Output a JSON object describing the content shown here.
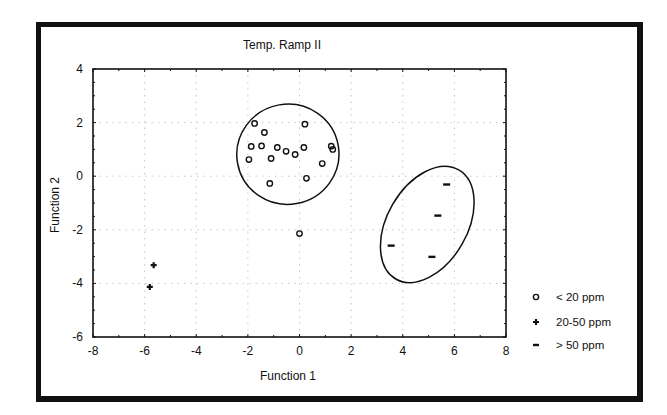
{
  "chart_data": {
    "type": "scatter",
    "title": "Temp. Ramp II",
    "xlabel": "Function 1",
    "ylabel": "Function 2",
    "xlim": [
      -8,
      8
    ],
    "ylim": [
      -6,
      4
    ],
    "xticks": [
      -8,
      -6,
      -4,
      -2,
      0,
      2,
      4,
      6,
      8
    ],
    "yticks": [
      -6,
      -4,
      -2,
      0,
      2,
      4
    ],
    "grid": true,
    "legend_position": "right-bottom",
    "series": [
      {
        "name": "< 20 ppm",
        "marker": "open-circle",
        "points": [
          [
            -1.74,
            1.97
          ],
          [
            0.21,
            1.94
          ],
          [
            -1.36,
            1.63
          ],
          [
            -1.87,
            1.11
          ],
          [
            -1.47,
            1.13
          ],
          [
            -0.86,
            1.07
          ],
          [
            -0.52,
            0.93
          ],
          [
            -0.17,
            0.81
          ],
          [
            0.17,
            1.07
          ],
          [
            1.23,
            1.12
          ],
          [
            1.29,
            1.0
          ],
          [
            -1.96,
            0.62
          ],
          [
            -1.1,
            0.66
          ],
          [
            0.88,
            0.47
          ],
          [
            -1.15,
            -0.27
          ],
          [
            0.27,
            -0.08
          ],
          [
            0.0,
            -2.14
          ]
        ]
      },
      {
        "name": "20-50 ppm",
        "marker": "plus",
        "points": [
          [
            -5.65,
            -3.32
          ],
          [
            -5.8,
            -4.13
          ]
        ]
      },
      {
        "name": "> 50 ppm",
        "marker": "dash",
        "points": [
          [
            5.7,
            -0.31
          ],
          [
            5.36,
            -1.47
          ],
          [
            3.55,
            -2.59
          ],
          [
            5.13,
            -3.01
          ]
        ]
      }
    ],
    "ellipses": [
      {
        "group": "< 20 ppm",
        "center": [
          -0.45,
          0.82
        ],
        "rx_units": 1.98,
        "ry_units": 1.87,
        "rotation_deg": -10
      },
      {
        "group": "> 50 ppm",
        "center": [
          4.95,
          -1.8
        ],
        "rx_units": 1.55,
        "ry_units": 2.35,
        "rotation_deg": 30
      }
    ]
  },
  "legend": {
    "items": [
      {
        "label": "< 20 ppm",
        "marker": "open-circle"
      },
      {
        "label": "20-50 ppm",
        "marker": "plus"
      },
      {
        "label": "> 50 ppm",
        "marker": "dash"
      }
    ]
  }
}
